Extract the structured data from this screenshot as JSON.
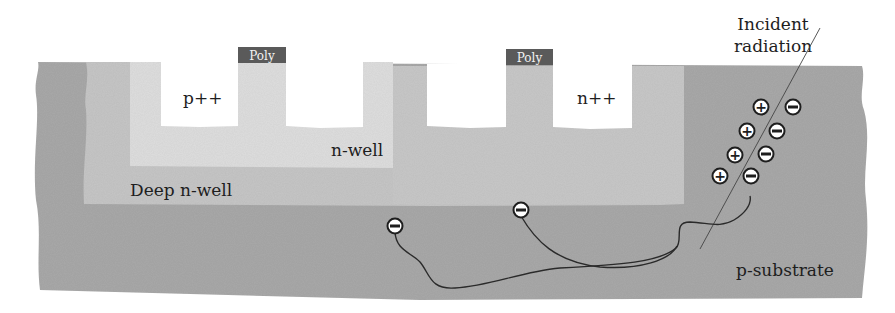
{
  "diagram": {
    "colors": {
      "background": "#ffffff",
      "p_substrate": "#a9a9a9",
      "deep_n_well": "#c6c6c6",
      "n_well": "#dedede",
      "diffusion": "#ffffff",
      "poly": "#5a5a5a",
      "text": "#1e1e1e",
      "trajectory": "#2a2a2a",
      "carrier_fill": "#ffffff",
      "carrier_stroke": "#1e1e1e"
    },
    "regions": {
      "p_substrate": "p-substrate",
      "deep_n_well": "Deep n-well",
      "n_well": "n-well",
      "p_diffusion": "p++",
      "n_diffusion": "n++"
    },
    "gates": [
      {
        "label": "Poly"
      },
      {
        "label": "Poly"
      }
    ],
    "radiation": {
      "label_line1": "Incident",
      "label_line2": "radiation"
    },
    "carriers": {
      "holes": [
        {
          "symbol": "+"
        },
        {
          "symbol": "+"
        },
        {
          "symbol": "+"
        },
        {
          "symbol": "+"
        }
      ],
      "electrons": [
        {
          "symbol": "−"
        },
        {
          "symbol": "−"
        },
        {
          "symbol": "−"
        },
        {
          "symbol": "−"
        }
      ],
      "collected_electrons": [
        {
          "symbol": "−"
        },
        {
          "symbol": "−"
        }
      ]
    }
  }
}
